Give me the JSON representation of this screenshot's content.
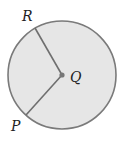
{
  "diagram": {
    "type": "circle-with-radii",
    "center": {
      "label": "Q",
      "x": 62,
      "y": 75
    },
    "radius": 54,
    "points": [
      {
        "label": "R",
        "x": 35,
        "y": 28
      },
      {
        "label": "P",
        "x": 26,
        "y": 115
      }
    ],
    "segments": [
      {
        "from": "Q",
        "to": "R"
      },
      {
        "from": "Q",
        "to": "P"
      }
    ],
    "colors": {
      "fill": "#e6e6e6",
      "stroke": "#7a7a7a",
      "center_dot": "#777777",
      "label": "#222222"
    }
  }
}
